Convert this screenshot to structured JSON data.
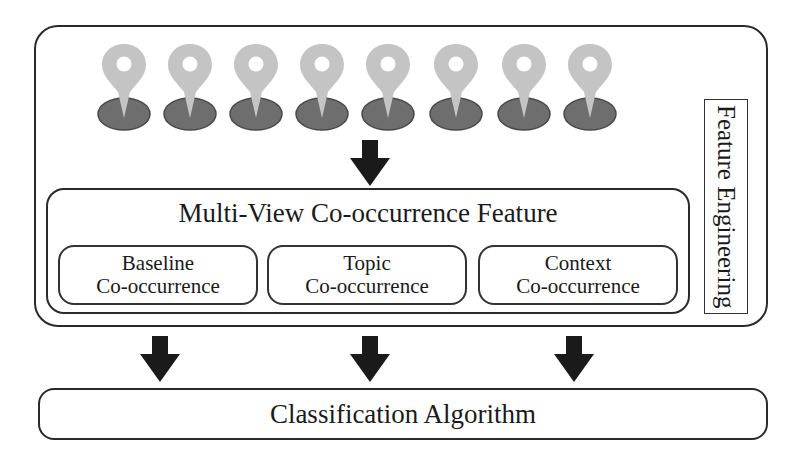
{
  "diagram": {
    "pins": {
      "count": 8,
      "icon": "map-pin-icon",
      "pin_color": "#c4c4c4",
      "base_color": "#6e6e6e"
    },
    "feature_engineering": {
      "label": "Feature Engineering"
    },
    "multi_view": {
      "title": "Multi-View Co-occurrence Feature",
      "subfeatures": [
        {
          "line1": "Baseline",
          "line2": "Co-occurrence"
        },
        {
          "line1": "Topic",
          "line2": "Co-occurrence"
        },
        {
          "line1": "Context",
          "line2": "Co-occurrence"
        }
      ]
    },
    "classification": {
      "label": "Classification Algorithm"
    },
    "arrows": {
      "color": "#1a1a1a",
      "icon": "arrow-down-icon"
    }
  }
}
